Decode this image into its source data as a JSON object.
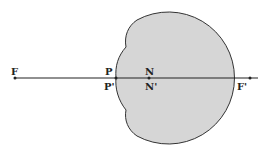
{
  "diagram": {
    "colors": {
      "eye_fill": "#d6d6d6",
      "stroke": "#333333",
      "background": "#ffffff"
    },
    "labels": {
      "F": "F",
      "P": "P",
      "P_prime": "P'",
      "N": "N",
      "N_prime": "N'",
      "F_prime": "F'"
    }
  }
}
